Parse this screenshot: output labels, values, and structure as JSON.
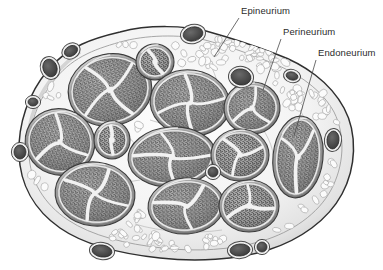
{
  "figure": {
    "type": "anatomical-illustration",
    "style": "grayscale line drawing with stipple shading",
    "background_color": "#ffffff"
  },
  "labels": [
    {
      "id": "epineurium",
      "text": "Epineurium",
      "x": 241,
      "y": 14,
      "leader_from": [
        239,
        18
      ],
      "leader_to": [
        214,
        57
      ],
      "description": "outermost connective tissue sheath of the whole nerve trunk"
    },
    {
      "id": "perineurium",
      "text": "Perineurium",
      "x": 283,
      "y": 35,
      "leader_from": [
        281,
        39
      ],
      "leader_to": [
        263,
        90
      ],
      "description": "dense sheath surrounding each individual fascicle"
    },
    {
      "id": "endoneurium",
      "text": "Endoneurium",
      "x": 318,
      "y": 56,
      "leader_from": [
        316,
        60
      ],
      "leader_to": [
        294,
        136
      ],
      "description": "loose connective tissue surrounding individual nerve fibers inside a fascicle"
    }
  ],
  "colors": {
    "outline": "#333333",
    "epineurium_fill": "#f4f4f4",
    "epineurium_shade": "#d9d9d9",
    "perineurium_ring": "#8c8c8c",
    "perineurium_inner": "#b9b9b9",
    "endoneurium_fill": "#9a9a9a",
    "endoneurium_stipple": "#3c3c3c",
    "septa": "#f2f2f2",
    "vessel_dark": "#4a4a4a",
    "vessel_rim": "#efefef",
    "cell_outline": "#b0b0b0",
    "label_text": "#2b2b2b",
    "leader_line": "#4a4a4a"
  },
  "structures": {
    "nerve_trunk": {
      "name": "nerve-trunk-outline",
      "shape": "irregular oval",
      "bounds": [
        18,
        28,
        348,
        248
      ]
    },
    "fascicles": [
      {
        "id": "f1",
        "cx": 110,
        "cy": 90,
        "rx": 42,
        "ry": 36,
        "rot": -12,
        "lobes": 4
      },
      {
        "id": "f2",
        "cx": 155,
        "cy": 62,
        "rx": 19,
        "ry": 18,
        "rot": 0,
        "lobes": 2
      },
      {
        "id": "f3",
        "cx": 190,
        "cy": 103,
        "rx": 40,
        "ry": 33,
        "rot": 8,
        "lobes": 4
      },
      {
        "id": "f4",
        "cx": 252,
        "cy": 108,
        "rx": 28,
        "ry": 26,
        "rot": -5,
        "lobes": 3
      },
      {
        "id": "f5",
        "cx": 60,
        "cy": 142,
        "rx": 35,
        "ry": 33,
        "rot": 20,
        "lobes": 3
      },
      {
        "id": "f6",
        "cx": 112,
        "cy": 140,
        "rx": 18,
        "ry": 19,
        "rot": 0,
        "lobes": 2
      },
      {
        "id": "f7",
        "cx": 172,
        "cy": 157,
        "rx": 44,
        "ry": 30,
        "rot": -4,
        "lobes": 4
      },
      {
        "id": "f8",
        "cx": 240,
        "cy": 155,
        "rx": 29,
        "ry": 26,
        "rot": 0,
        "lobes": 3
      },
      {
        "id": "f9",
        "cx": 298,
        "cy": 157,
        "rx": 25,
        "ry": 41,
        "rot": 6,
        "lobes": 3
      },
      {
        "id": "f10",
        "cx": 95,
        "cy": 194,
        "rx": 40,
        "ry": 32,
        "rot": 6,
        "lobes": 4
      },
      {
        "id": "f11",
        "cx": 186,
        "cy": 206,
        "rx": 38,
        "ry": 28,
        "rot": -4,
        "lobes": 3
      },
      {
        "id": "f12",
        "cx": 249,
        "cy": 206,
        "rx": 30,
        "ry": 26,
        "rot": 0,
        "lobes": 3
      }
    ],
    "blood_vessels": [
      {
        "id": "v1",
        "cx": 193,
        "cy": 34,
        "rx": 10,
        "ry": 7,
        "rot": -12
      },
      {
        "id": "v2",
        "cx": 71,
        "cy": 51,
        "rx": 7,
        "ry": 5,
        "rot": -30
      },
      {
        "id": "v3",
        "cx": 50,
        "cy": 68,
        "rx": 7,
        "ry": 9,
        "rot": -18
      },
      {
        "id": "v4",
        "cx": 241,
        "cy": 77,
        "rx": 10,
        "ry": 8,
        "rot": 10
      },
      {
        "id": "v5",
        "cx": 292,
        "cy": 76,
        "rx": 6,
        "ry": 4,
        "rot": 15
      },
      {
        "id": "v6",
        "cx": 333,
        "cy": 140,
        "rx": 6,
        "ry": 9,
        "rot": 6
      },
      {
        "id": "v7",
        "cx": 20,
        "cy": 152,
        "rx": 6,
        "ry": 7,
        "rot": 0
      },
      {
        "id": "v8",
        "cx": 213,
        "cy": 172,
        "rx": 5,
        "ry": 5,
        "rot": 0
      },
      {
        "id": "v9",
        "cx": 102,
        "cy": 251,
        "rx": 10,
        "ry": 6,
        "rot": 8
      },
      {
        "id": "v10",
        "cx": 240,
        "cy": 250,
        "rx": 10,
        "ry": 6,
        "rot": -4
      },
      {
        "id": "v11",
        "cx": 262,
        "cy": 247,
        "rx": 5,
        "ry": 5,
        "rot": 0
      },
      {
        "id": "v12",
        "cx": 33,
        "cy": 102,
        "rx": 5,
        "ry": 4,
        "rot": 0
      }
    ],
    "adipose_cell_count": 150
  }
}
